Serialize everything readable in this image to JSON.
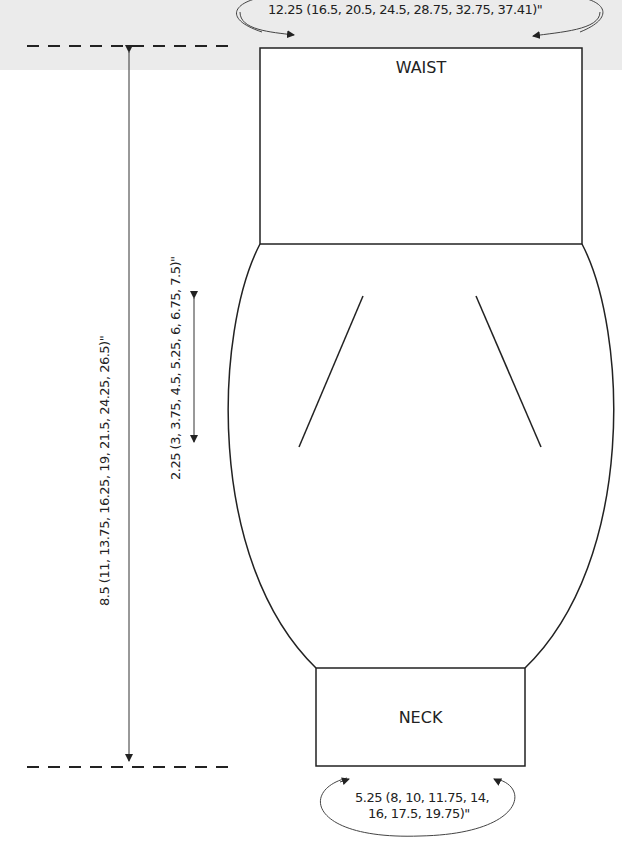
{
  "diagram": {
    "type": "knitting schematic",
    "sections": {
      "waist": {
        "label": "WAIST"
      },
      "neck": {
        "label": "NECK"
      }
    },
    "measurements": {
      "waist_width": "12.25 (16.5, 20.5, 24.5, 28.75, 32.75, 37.41)\"",
      "total_length": "8.5 (11, 13.75, 16.25, 19, 21.5, 24.25, 26.5)\"",
      "dart_length": "2.25 (3, 3.75, 4.5, 5.25, 6, 6.75, 7.5)\"",
      "neck_width_line1": "5.25 (8, 10, 11.75, 14,",
      "neck_width_line2": "16, 17.5, 19.75)\""
    },
    "colors": {
      "line": "#222222",
      "band": "#ebebeb",
      "background": "#ffffff"
    }
  }
}
